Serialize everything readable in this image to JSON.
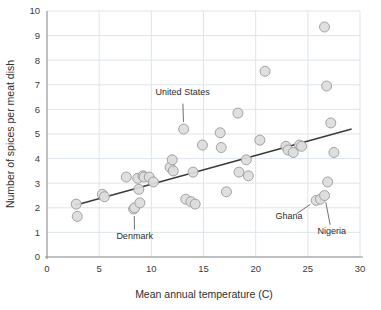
{
  "chart_data": {
    "type": "scatter",
    "title": "",
    "xlabel": "Mean annual temperature (C)",
    "ylabel": "Number of spices per meat dish",
    "xlim": [
      0,
      30
    ],
    "ylim": [
      0,
      10
    ],
    "xticks": [
      "0",
      "5",
      "10",
      "15",
      "20",
      "25",
      "30"
    ],
    "yticks": [
      "0",
      "1",
      "2",
      "3",
      "4",
      "5",
      "6",
      "7",
      "8",
      "9",
      "10"
    ],
    "grid": true,
    "legend": "none",
    "marker_fill": "#dcdcdc",
    "marker_edge": "#9a9a9a",
    "trendline_color": "#3a3a3a",
    "grid_color": "#d9e2ea",
    "axis_color": "#8d8d8d",
    "points": [
      {
        "x": 2.8,
        "y": 2.15
      },
      {
        "x": 2.9,
        "y": 1.65
      },
      {
        "x": 5.3,
        "y": 2.55
      },
      {
        "x": 5.5,
        "y": 2.45
      },
      {
        "x": 7.6,
        "y": 3.25
      },
      {
        "x": 8.3,
        "y": 1.95
      },
      {
        "x": 8.4,
        "y": 2.0
      },
      {
        "x": 8.7,
        "y": 3.2
      },
      {
        "x": 8.8,
        "y": 2.75
      },
      {
        "x": 8.9,
        "y": 2.2
      },
      {
        "x": 9.2,
        "y": 3.3
      },
      {
        "x": 9.3,
        "y": 3.25
      },
      {
        "x": 9.8,
        "y": 3.25
      },
      {
        "x": 10.2,
        "y": 3.05
      },
      {
        "x": 11.8,
        "y": 3.65
      },
      {
        "x": 12.0,
        "y": 3.95
      },
      {
        "x": 12.1,
        "y": 3.5
      },
      {
        "x": 13.1,
        "y": 5.2
      },
      {
        "x": 13.3,
        "y": 2.35
      },
      {
        "x": 13.8,
        "y": 2.25
      },
      {
        "x": 14.0,
        "y": 3.45
      },
      {
        "x": 14.2,
        "y": 2.15
      },
      {
        "x": 14.9,
        "y": 4.55
      },
      {
        "x": 16.6,
        "y": 5.05
      },
      {
        "x": 16.7,
        "y": 4.45
      },
      {
        "x": 17.2,
        "y": 2.65
      },
      {
        "x": 18.3,
        "y": 5.85
      },
      {
        "x": 18.4,
        "y": 3.45
      },
      {
        "x": 19.1,
        "y": 3.95
      },
      {
        "x": 19.3,
        "y": 3.3
      },
      {
        "x": 20.4,
        "y": 4.75
      },
      {
        "x": 20.9,
        "y": 7.55
      },
      {
        "x": 22.9,
        "y": 4.5
      },
      {
        "x": 23.1,
        "y": 4.35
      },
      {
        "x": 23.6,
        "y": 4.25
      },
      {
        "x": 24.2,
        "y": 4.55
      },
      {
        "x": 24.4,
        "y": 4.5
      },
      {
        "x": 26.6,
        "y": 9.35
      },
      {
        "x": 26.8,
        "y": 6.95
      },
      {
        "x": 26.9,
        "y": 3.05
      },
      {
        "x": 27.2,
        "y": 5.45
      },
      {
        "x": 27.5,
        "y": 4.25
      },
      {
        "x": 25.8,
        "y": 2.3
      },
      {
        "x": 26.2,
        "y": 2.35
      },
      {
        "x": 26.6,
        "y": 2.5
      }
    ],
    "trendline": {
      "x1": 2.7,
      "y1": 2.1,
      "x2": 29.2,
      "y2": 5.2
    },
    "annotations": [
      {
        "label": "United States",
        "text_x": 13.0,
        "text_y": 6.6,
        "point_x": 13.1,
        "point_y": 5.2
      },
      {
        "label": "Denmark",
        "text_x": 8.4,
        "text_y": 0.75,
        "point_x": 8.35,
        "point_y": 1.95
      },
      {
        "label": "Ghana",
        "text_x": 23.2,
        "text_y": 1.55,
        "point_x": 25.8,
        "point_y": 2.3
      },
      {
        "label": "Nigeria",
        "text_x": 27.3,
        "text_y": 0.95,
        "point_x": 26.6,
        "point_y": 2.5
      }
    ]
  }
}
